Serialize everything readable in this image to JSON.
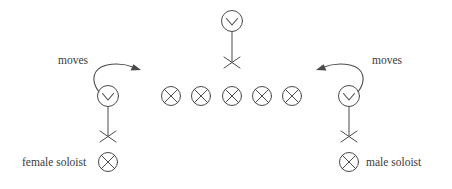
{
  "figure": {
    "background_color": "#ffffff",
    "ink_color": "#4a4a4a",
    "text_color": "#3a3a3a",
    "width": 452,
    "height": 189
  },
  "labels": {
    "moves_left": "moves",
    "moves_right": "moves",
    "legend_female": "female soloist",
    "legend_male": "male soloist"
  },
  "performers": [
    {
      "id": "top-chorus-dancer",
      "role": "chorus member",
      "symbol": "dancer-figure",
      "x": 232,
      "y": 21
    },
    {
      "id": "female-soloist-figure",
      "role": "female soloist",
      "symbol": "dancer-figure",
      "x": 108,
      "y": 96
    },
    {
      "id": "male-soloist-figure",
      "role": "male soloist",
      "symbol": "dancer-figure",
      "x": 349,
      "y": 96
    }
  ],
  "chorus_row": {
    "symbol": "circled-cross",
    "count": 5,
    "y": 96,
    "x_positions": [
      171,
      201,
      232,
      262,
      292
    ]
  },
  "arrows": [
    {
      "id": "left-move-arrow",
      "direction": "right",
      "label": "moves",
      "label_x": 58,
      "label_y": 64,
      "from": [
        100,
        88
      ],
      "to": [
        138,
        70
      ]
    },
    {
      "id": "right-move-arrow",
      "direction": "left",
      "label": "moves",
      "label_x": 372,
      "label_y": 64,
      "from": [
        357,
        88
      ],
      "to": [
        320,
        70
      ]
    }
  ],
  "legend": [
    {
      "id": "legend-female-soloist",
      "text": "female soloist",
      "symbol": "circled-cross",
      "text_x": 22,
      "symbol_x": 108,
      "y": 162,
      "symbol_side": "right"
    },
    {
      "id": "legend-male-soloist",
      "text": "male soloist",
      "symbol": "circled-cross",
      "text_x": 364,
      "symbol_x": 349,
      "y": 162,
      "symbol_side": "left"
    }
  ]
}
